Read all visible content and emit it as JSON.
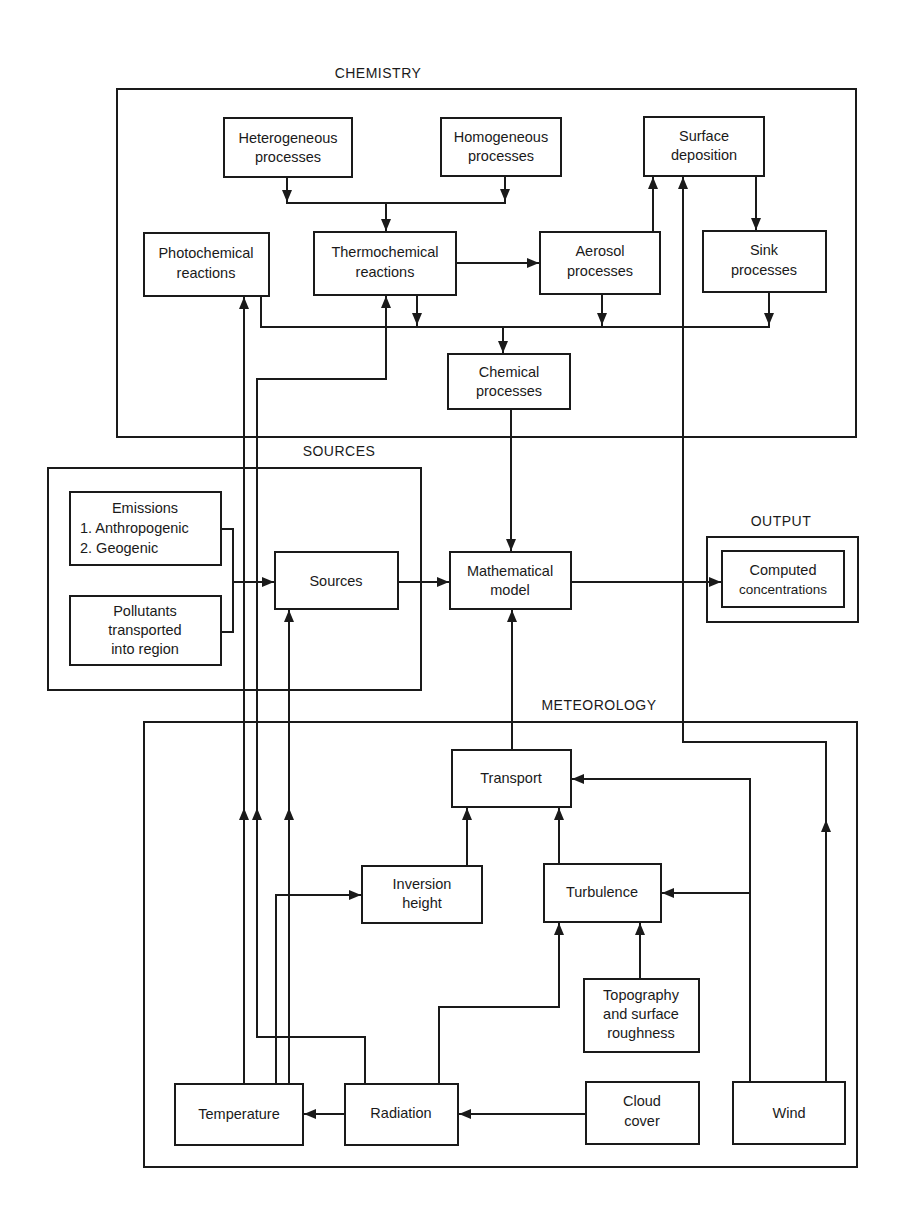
{
  "sections": {
    "chemistry": "CHEMISTRY",
    "sources": "SOURCES",
    "output": "OUTPUT",
    "meteorology": "METEOROLOGY"
  },
  "chemistry": {
    "heterogeneous": [
      "Heterogeneous",
      "processes"
    ],
    "homogeneous": [
      "Homogeneous",
      "processes"
    ],
    "surface_deposition": [
      "Surface",
      "deposition"
    ],
    "photochemical": [
      "Photochemical",
      "reactions"
    ],
    "thermochemical": [
      "Thermochemical",
      "reactions"
    ],
    "aerosol": [
      "Aerosol",
      "processes"
    ],
    "sink": [
      "Sink",
      "processes"
    ],
    "chemical_processes": [
      "Chemical",
      "processes"
    ]
  },
  "sources": {
    "emissions": [
      "Emissions",
      "1. Anthropogenic",
      "2. Geogenic"
    ],
    "pollutants": [
      "Pollutants",
      "transported",
      "into region"
    ],
    "sources_box": "Sources"
  },
  "model": {
    "mathematical_model": [
      "Mathematical",
      "model"
    ]
  },
  "output": {
    "computed": [
      "Computed",
      "concentrations"
    ]
  },
  "meteorology": {
    "transport": "Transport",
    "inversion": [
      "Inversion",
      "height"
    ],
    "turbulence": "Turbulence",
    "topography": [
      "Topography",
      "and surface",
      "roughness"
    ],
    "temperature": "Temperature",
    "radiation": "Radiation",
    "cloud_cover": [
      "Cloud",
      "cover"
    ],
    "wind": "Wind"
  }
}
